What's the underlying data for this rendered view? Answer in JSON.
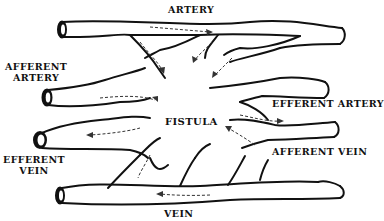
{
  "diagram": {
    "colors": {
      "background": "#ffffff",
      "stroke": "#111111",
      "flow_arrows": "#333333"
    },
    "labels": {
      "artery": "ARTERY",
      "afferent_artery_line1": "AFFERENT",
      "afferent_artery_line2": "ARTERY",
      "fistula": "FISTULA",
      "efferent_artery": "EFFERENT ARTERY",
      "efferent_vein_line1": "EFFERENT",
      "efferent_vein_line2": "VEIN",
      "afferent_vein": "AFFERENT VEIN",
      "vein": "VEIN"
    },
    "vessels": [
      {
        "name": "artery",
        "position": "top",
        "flow": "left-to-right"
      },
      {
        "name": "afferent-artery",
        "position": "upper-left",
        "flow": "into-fistula"
      },
      {
        "name": "efferent-artery",
        "position": "right-middle",
        "flow": "out-of-fistula"
      },
      {
        "name": "efferent-vein",
        "position": "left-middle",
        "flow": "out-of-fistula"
      },
      {
        "name": "afferent-vein",
        "position": "lower-right",
        "flow": "into-fistula"
      },
      {
        "name": "vein",
        "position": "bottom",
        "flow": "right-to-left"
      }
    ]
  }
}
